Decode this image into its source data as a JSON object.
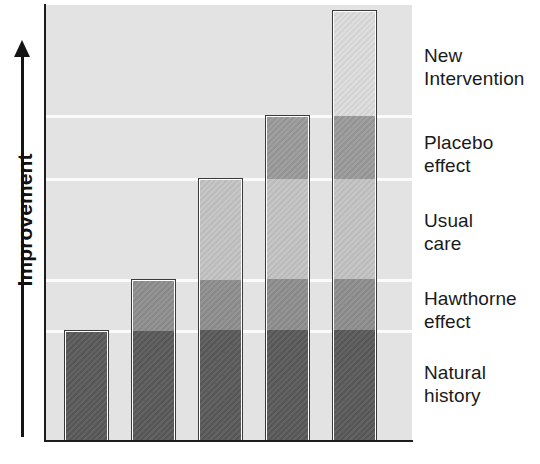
{
  "chart_data": {
    "type": "bar",
    "subtype": "cumulative-stacked",
    "title": "",
    "xlabel": "",
    "ylabel": "Improvement",
    "ylabel_arrow": "up-arrow",
    "grid": true,
    "gridlines_y": [
      115,
      178,
      279,
      330
    ],
    "legend_position": "right-inline",
    "axis_ranges": {
      "y_display": "unlabeled ordinal scale, increasing upward"
    },
    "categories": [
      "Bar 1",
      "Bar 2",
      "Bar 3",
      "Bar 4",
      "Bar 5"
    ],
    "segment_names": [
      "Natural history",
      "Hawthorne effect",
      "Usual care",
      "Placebo effect",
      "New Intervention"
    ],
    "segment_colors": [
      "#5a5a5a",
      "#8e8e8e",
      "#c3c3c3",
      "#9a9a9a",
      "#dcdcdc"
    ],
    "series": [
      {
        "name": "Natural history",
        "values": [
          111,
          162,
          263,
          263,
          263
        ]
      },
      {
        "name": "Hawthorne effect",
        "values": [
          0,
          0,
          0,
          51,
          51
        ]
      },
      {
        "name": "Usual care",
        "values": [
          0,
          0,
          0,
          101,
          101
        ]
      },
      {
        "name": "Placebo effect",
        "values": [
          0,
          0,
          0,
          0,
          63
        ]
      },
      {
        "name": "New Intervention",
        "values": [
          0,
          0,
          0,
          0,
          105
        ]
      }
    ],
    "bar_totals": [
      111,
      162,
      263,
      326,
      431
    ],
    "bar_tops_px": [
      330,
      279,
      178,
      115,
      10
    ],
    "annotation": "Each successive bar accumulates an additional contribution to apparent improvement."
  },
  "axis": {
    "y_label_text": "Improvement"
  },
  "legend_labels": [
    {
      "id": "new-intervention",
      "text": "New\nIntervention",
      "top": 44
    },
    {
      "id": "placebo-effect",
      "text": "Placebo\neffect",
      "top": 131
    },
    {
      "id": "usual-care",
      "text": "Usual\ncare",
      "top": 209
    },
    {
      "id": "hawthorne-effect",
      "text": "Hawthorne\neffect",
      "top": 287
    },
    {
      "id": "natural-history",
      "text": "Natural\nhistory",
      "top": 361
    }
  ],
  "bars": [
    {
      "id": "bar-1",
      "left": 64,
      "width": 45,
      "height": 111,
      "segments": [
        {
          "name": "Natural history",
          "height": 111,
          "color": "#5a5a5a"
        }
      ]
    },
    {
      "id": "bar-2",
      "left": 131,
      "width": 45,
      "height": 162,
      "segments": [
        {
          "name": "Natural history",
          "height": 111,
          "color": "#5a5a5a"
        },
        {
          "name": "Hawthorne effect",
          "height": 51,
          "color": "#8e8e8e"
        }
      ]
    },
    {
      "id": "bar-3",
      "left": 198,
      "width": 45,
      "height": 263,
      "segments": [
        {
          "name": "Natural history",
          "height": 111,
          "color": "#5a5a5a"
        },
        {
          "name": "Hawthorne effect",
          "height": 51,
          "color": "#8e8e8e"
        },
        {
          "name": "Usual care",
          "height": 101,
          "color": "#c3c3c3"
        }
      ]
    },
    {
      "id": "bar-4",
      "left": 265,
      "width": 45,
      "height": 326,
      "segments": [
        {
          "name": "Natural history",
          "height": 111,
          "color": "#5a5a5a"
        },
        {
          "name": "Hawthorne effect",
          "height": 51,
          "color": "#8e8e8e"
        },
        {
          "name": "Usual care",
          "height": 101,
          "color": "#c3c3c3"
        },
        {
          "name": "Placebo effect",
          "height": 63,
          "color": "#9a9a9a"
        }
      ]
    },
    {
      "id": "bar-5",
      "left": 332,
      "width": 45,
      "height": 431,
      "segments": [
        {
          "name": "Natural history",
          "height": 111,
          "color": "#5a5a5a"
        },
        {
          "name": "Hawthorne effect",
          "height": 51,
          "color": "#8e8e8e"
        },
        {
          "name": "Usual care",
          "height": 101,
          "color": "#c3c3c3"
        },
        {
          "name": "Placebo effect",
          "height": 63,
          "color": "#9a9a9a"
        },
        {
          "name": "New Intervention",
          "height": 105,
          "color": "#dcdcdc"
        }
      ]
    }
  ],
  "plot": {
    "left": 45,
    "top": 5,
    "width": 367,
    "height": 436,
    "background": "#e3e3e3",
    "gridline_color": "#fbfbfb",
    "axis_color": "#1c1c1c"
  }
}
